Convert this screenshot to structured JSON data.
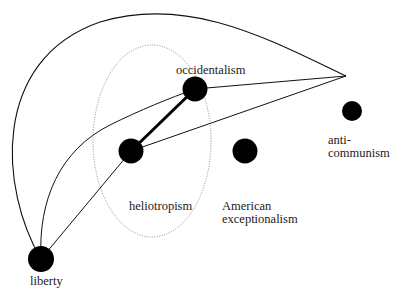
{
  "diagram": {
    "type": "concept-network",
    "nodes": [
      {
        "id": "occidentalism",
        "label": "occidentalism",
        "x": 195,
        "y": 89,
        "r": 12
      },
      {
        "id": "heliotropism",
        "label": "heliotropism",
        "x": 131,
        "y": 151,
        "r": 12
      },
      {
        "id": "american-exceptionalism",
        "label_line1": "American",
        "label_line2": "exceptionalism",
        "x": 245,
        "y": 151,
        "r": 12
      },
      {
        "id": "anti-communism",
        "label_line1": "anti-",
        "label_line2": "communism",
        "x": 352,
        "y": 111,
        "r": 10
      },
      {
        "id": "liberty",
        "label": "liberty",
        "x": 41,
        "y": 259,
        "r": 13
      }
    ],
    "apex": {
      "x": 346,
      "y": 76
    },
    "edges": [
      {
        "from": "occidentalism",
        "to": "heliotropism",
        "style": "thick"
      },
      {
        "from": "occidentalism",
        "to": "apex",
        "style": "thin"
      },
      {
        "from": "heliotropism",
        "to": "apex",
        "style": "thin"
      },
      {
        "from": "liberty",
        "to": "heliotropism",
        "style": "thin"
      },
      {
        "from": "liberty",
        "to": "occidentalism",
        "style": "thin-curve"
      },
      {
        "from": "liberty",
        "to": "apex",
        "style": "outer-curve"
      }
    ],
    "region": {
      "label": "heliotropism",
      "shape": "dotted-ellipse",
      "cx": 152,
      "cy": 141,
      "rx": 59,
      "ry": 96
    },
    "colors": {
      "node": "#000000",
      "line": "#111111",
      "ellipse": "#888888",
      "text": "#222222"
    }
  },
  "labels": {
    "occidentalism": "occidentalism",
    "heliotropism": "heliotropism",
    "american_line1": "American",
    "american_line2": "exceptionalism",
    "anti_line1": "anti-",
    "anti_line2": "communism",
    "liberty": "liberty"
  }
}
